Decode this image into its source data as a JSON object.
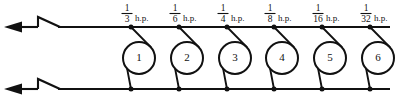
{
  "diagram": {
    "line_color": "#111111",
    "background": "#ffffff",
    "top_bus": {
      "label": "top-supply-conductor",
      "y": 27
    },
    "bottom_bus": {
      "label": "bottom-supply-conductor",
      "y": 89
    },
    "feed_direction": "left",
    "break_symbol": "zigzag",
    "branches": [
      {
        "id": 1,
        "motor_label": "1",
        "numerator": "1",
        "denominator": "3",
        "unit": "h.p.",
        "x": 139
      },
      {
        "id": 2,
        "motor_label": "2",
        "numerator": "1",
        "denominator": "6",
        "unit": "h.p.",
        "x": 187
      },
      {
        "id": 3,
        "motor_label": "3",
        "numerator": "1",
        "denominator": "4",
        "unit": "h.p.",
        "x": 235
      },
      {
        "id": 4,
        "motor_label": "4",
        "numerator": "1",
        "denominator": "8",
        "unit": "h.p.",
        "x": 282
      },
      {
        "id": 5,
        "motor_label": "5",
        "numerator": "1",
        "denominator": "16",
        "unit": "h.p.",
        "x": 330
      },
      {
        "id": 6,
        "motor_label": "6",
        "numerator": "1",
        "denominator": "32",
        "unit": "h.p.",
        "x": 378
      }
    ]
  }
}
